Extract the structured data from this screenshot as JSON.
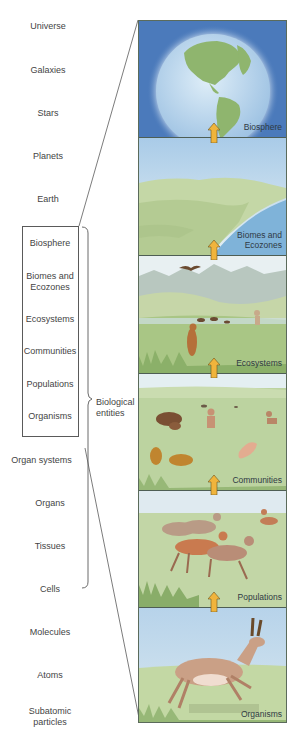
{
  "levels": [
    {
      "label": "Universe"
    },
    {
      "label": "Galaxies"
    },
    {
      "label": "Stars"
    },
    {
      "label": "Planets"
    },
    {
      "label": "Earth"
    },
    {
      "label": "Biosphere"
    },
    {
      "label": "Biomes and Ecozones"
    },
    {
      "label": "Ecosystems"
    },
    {
      "label": "Communities"
    },
    {
      "label": "Populations"
    },
    {
      "label": "Organisms"
    },
    {
      "label": "Organ systems"
    },
    {
      "label": "Organs"
    },
    {
      "label": "Tissues"
    },
    {
      "label": "Cells"
    },
    {
      "label": "Molecules"
    },
    {
      "label": "Atoms"
    },
    {
      "label": "Subatomic particles"
    }
  ],
  "bracket_label": "Biological entities",
  "panels": [
    {
      "label": "Biosphere",
      "scene": "globe-earth-americas"
    },
    {
      "label": "Biomes and Ecozones",
      "scene": "coastal-landscape"
    },
    {
      "label": "Ecosystems",
      "scene": "mountain-grassland-with-animals"
    },
    {
      "label": "Communities",
      "scene": "mixed-grassland-animals"
    },
    {
      "label": "Populations",
      "scene": "pronghorn-herd"
    },
    {
      "label": "Organisms",
      "scene": "single-pronghorn"
    }
  ],
  "colors": {
    "arrow": "#f0b43c",
    "arrow_outline": "#6b5420",
    "sky_blue": "#4f7fbf",
    "grass": "#b9cf9a",
    "line": "#5a5a5a"
  }
}
